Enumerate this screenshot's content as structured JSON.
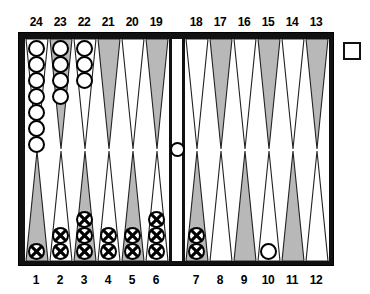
{
  "board": {
    "title": "Backgammon Board Position",
    "colors": {
      "frame": "#111111",
      "surface": "#ffffff",
      "point_shaded": "#b8b8b8",
      "point_light": "#ffffff",
      "checker_white": "#ffffff",
      "checker_outline": "#000000",
      "checker_cross": "#000000"
    },
    "top_labels": [
      "24",
      "23",
      "22",
      "21",
      "20",
      "19",
      "18",
      "17",
      "16",
      "15",
      "14",
      "13"
    ],
    "bottom_labels": [
      "1",
      "2",
      "3",
      "4",
      "5",
      "6",
      "7",
      "8",
      "9",
      "10",
      "11",
      "12"
    ],
    "bar": {
      "name": "bar",
      "checkers": 1,
      "checker_type": "white"
    },
    "doubling_cube": {
      "name": "doubling-cube",
      "value": ""
    },
    "points": [
      {
        "number": "24",
        "quadrant": "top-left",
        "slot": 0,
        "shade": "light",
        "checkers": 7,
        "type": "white"
      },
      {
        "number": "23",
        "quadrant": "top-left",
        "slot": 1,
        "shade": "shaded",
        "checkers": 4,
        "type": "white"
      },
      {
        "number": "22",
        "quadrant": "top-left",
        "slot": 2,
        "shade": "light",
        "checkers": 3,
        "type": "white"
      },
      {
        "number": "21",
        "quadrant": "top-left",
        "slot": 3,
        "shade": "shaded",
        "checkers": 0,
        "type": "none"
      },
      {
        "number": "20",
        "quadrant": "top-left",
        "slot": 4,
        "shade": "light",
        "checkers": 0,
        "type": "none"
      },
      {
        "number": "19",
        "quadrant": "top-left",
        "slot": 5,
        "shade": "shaded",
        "checkers": 0,
        "type": "none"
      },
      {
        "number": "18",
        "quadrant": "top-right",
        "slot": 0,
        "shade": "light",
        "checkers": 0,
        "type": "none"
      },
      {
        "number": "17",
        "quadrant": "top-right",
        "slot": 1,
        "shade": "shaded",
        "checkers": 0,
        "type": "none"
      },
      {
        "number": "16",
        "quadrant": "top-right",
        "slot": 2,
        "shade": "light",
        "checkers": 0,
        "type": "none"
      },
      {
        "number": "15",
        "quadrant": "top-right",
        "slot": 3,
        "shade": "shaded",
        "checkers": 0,
        "type": "none"
      },
      {
        "number": "14",
        "quadrant": "top-right",
        "slot": 4,
        "shade": "light",
        "checkers": 0,
        "type": "none"
      },
      {
        "number": "13",
        "quadrant": "top-right",
        "slot": 5,
        "shade": "shaded",
        "checkers": 0,
        "type": "none"
      },
      {
        "number": "1",
        "quadrant": "bottom-left",
        "slot": 0,
        "shade": "shaded",
        "checkers": 1,
        "type": "cross"
      },
      {
        "number": "2",
        "quadrant": "bottom-left",
        "slot": 1,
        "shade": "light",
        "checkers": 2,
        "type": "cross"
      },
      {
        "number": "3",
        "quadrant": "bottom-left",
        "slot": 2,
        "shade": "shaded",
        "checkers": 3,
        "type": "cross"
      },
      {
        "number": "4",
        "quadrant": "bottom-left",
        "slot": 3,
        "shade": "light",
        "checkers": 2,
        "type": "cross"
      },
      {
        "number": "5",
        "quadrant": "bottom-left",
        "slot": 4,
        "shade": "shaded",
        "checkers": 2,
        "type": "cross"
      },
      {
        "number": "6",
        "quadrant": "bottom-left",
        "slot": 5,
        "shade": "light",
        "checkers": 3,
        "type": "cross"
      },
      {
        "number": "7",
        "quadrant": "bottom-right",
        "slot": 0,
        "shade": "shaded",
        "checkers": 2,
        "type": "cross"
      },
      {
        "number": "8",
        "quadrant": "bottom-right",
        "slot": 1,
        "shade": "light",
        "checkers": 0,
        "type": "none"
      },
      {
        "number": "9",
        "quadrant": "bottom-right",
        "slot": 2,
        "shade": "shaded",
        "checkers": 0,
        "type": "none"
      },
      {
        "number": "10",
        "quadrant": "bottom-right",
        "slot": 3,
        "shade": "light",
        "checkers": 1,
        "type": "white"
      },
      {
        "number": "11",
        "quadrant": "bottom-right",
        "slot": 4,
        "shade": "shaded",
        "checkers": 0,
        "type": "none"
      },
      {
        "number": "12",
        "quadrant": "bottom-right",
        "slot": 5,
        "shade": "light",
        "checkers": 0,
        "type": "none"
      }
    ]
  }
}
